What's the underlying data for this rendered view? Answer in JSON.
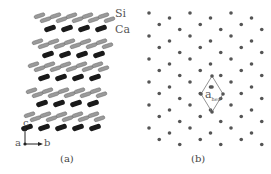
{
  "figure": {
    "panel_a": {
      "caption": "(a)",
      "legend": {
        "si_label": "Si",
        "ca_label": "Ca"
      },
      "axes": {
        "c_label": "c",
        "a_label": "a",
        "b_label": "b"
      },
      "colors": {
        "si": "#9a9a9a",
        "ca": "#1a1a1a"
      }
    },
    "panel_b": {
      "caption": "(b)",
      "unit_cell_label": "a",
      "unit_cell_subscript": "hex",
      "colors": {
        "atom": "#555555",
        "cell": "#777777"
      }
    }
  }
}
